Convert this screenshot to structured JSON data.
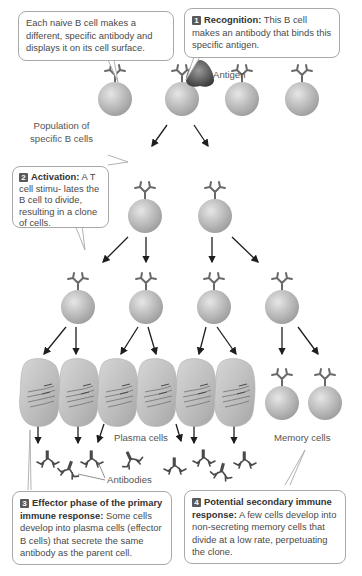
{
  "callouts": {
    "naive": {
      "text": "Each naive B cell makes a different, specific antibody and displays it on its cell surface."
    },
    "step1": {
      "number": "1",
      "heading": "Recognition:",
      "text": " This B cell makes an antibody that binds this specific antigen."
    },
    "step2": {
      "number": "2",
      "heading": "Activation:",
      "text": " A T cell stimu- lates the B cell to divide, resulting in a clone of cells."
    },
    "step3": {
      "number": "3",
      "heading": "Effector phase of the primary immune response:",
      "text": " Some cells develop into plasma cells (effector B cells) that secrete the same antibody as the parent cell."
    },
    "step4": {
      "number": "4",
      "heading": "Potential secondary immune response:",
      "text": " A few cells develop into non-secreting memory cells that divide at a low rate, perpetuating the clone."
    }
  },
  "labels": {
    "antigen": "Antigen",
    "population_line1": "Population of",
    "population_line2": "specific B cells",
    "plasma_cells": "Plasma cells",
    "memory_cells": "Memory cells",
    "antibodies": "Antibodies"
  },
  "colors": {
    "cell_fill": "#bdbdbd",
    "cell_highlight": "#e4e4e4",
    "badge": "#5a5a5a",
    "callout_border": "#a9a9a9",
    "arrow": "#1e1e1e"
  }
}
